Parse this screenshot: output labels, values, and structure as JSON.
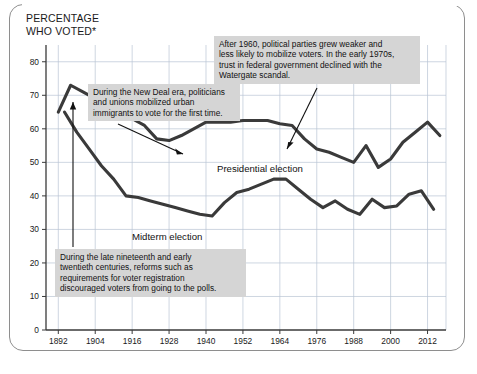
{
  "figure": {
    "title_line1": "PERCENTAGE",
    "title_line2": "WHO VOTED*",
    "border_color": "#8e8e8e",
    "background": "#ffffff"
  },
  "annotations": [
    {
      "id": "watergate",
      "text": "After 1960, political parties grew weaker and\nless likely to mobilize voters. In the early 1970s,\ntrust in federal government declined with the\nWatergate scandal.",
      "background": "#d5d5d5"
    },
    {
      "id": "newdeal",
      "text": "During the New Deal era, politicians\nand unions mobilized urban\nimmigrants to vote for the first time.",
      "background": "#d5d5d5"
    },
    {
      "id": "reforms",
      "text": "During the late nineteenth and early\ntwentieth centuries, reforms such as\nrequirements for voter registration\ndiscouraged voters from going to the polls.",
      "background": "#d5d5d5"
    }
  ],
  "series_labels": {
    "presidential": "Presidential election",
    "midterm": "Midterm election"
  },
  "chart_data": {
    "type": "line",
    "title": "PERCENTAGE WHO VOTED*",
    "xlabel": "",
    "ylabel": "PERCENTAGE WHO VOTED*",
    "xlim": [
      1888,
      2018
    ],
    "ylim": [
      0,
      85
    ],
    "y_ticks": [
      0,
      10,
      20,
      30,
      40,
      50,
      60,
      70,
      80
    ],
    "x_ticks": [
      1892,
      1904,
      1916,
      1928,
      1940,
      1952,
      1964,
      1976,
      1988,
      2000,
      2012
    ],
    "grid": true,
    "legend": "inline-labels",
    "line_color": "#3a3a3a",
    "grid_color": "#b9c4d4",
    "series": [
      {
        "name": "Presidential election",
        "x": [
          1892,
          1896,
          1900,
          1904,
          1908,
          1912,
          1916,
          1920,
          1924,
          1928,
          1932,
          1936,
          1940,
          1944,
          1948,
          1952,
          1956,
          1960,
          1964,
          1968,
          1972,
          1976,
          1980,
          1984,
          1988,
          1992,
          1996,
          2000,
          2004,
          2008,
          2012,
          2016
        ],
        "values": [
          65,
          73,
          71,
          69,
          67,
          65,
          63,
          61,
          57,
          56.5,
          58,
          60,
          62,
          62,
          62,
          62.5,
          62.5,
          62.5,
          61.5,
          61,
          57,
          54,
          53,
          51.5,
          50,
          55,
          48.5,
          51,
          56,
          59,
          62,
          58
        ]
      },
      {
        "name": "Midterm election",
        "x": [
          1894,
          1898,
          1902,
          1906,
          1910,
          1914,
          1918,
          1922,
          1926,
          1930,
          1934,
          1938,
          1942,
          1946,
          1950,
          1954,
          1958,
          1962,
          1966,
          1970,
          1974,
          1978,
          1982,
          1986,
          1990,
          1994,
          1998,
          2002,
          2006,
          2010,
          2014
        ],
        "values": [
          65,
          59,
          54,
          49,
          45,
          40,
          39.5,
          38.5,
          37.5,
          36.5,
          35.5,
          34.5,
          34,
          38,
          41,
          42,
          43.5,
          45,
          45,
          42,
          39,
          36.5,
          38.5,
          36,
          34.5,
          39,
          36.5,
          37,
          40.5,
          41.5,
          36
        ]
      }
    ]
  }
}
